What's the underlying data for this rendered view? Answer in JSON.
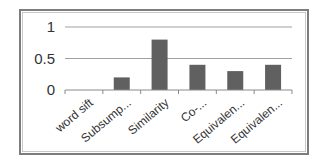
{
  "chart_data": {
    "type": "bar",
    "title": "",
    "xlabel": "",
    "ylabel": "",
    "categories": [
      "word sift",
      "Subsump...",
      "Similarity",
      "Co-...",
      "Equivalen...",
      "Equivalen..."
    ],
    "values": [
      0,
      0.2,
      0.8,
      0.4,
      0.3,
      0.4
    ],
    "ylim": [
      0,
      1
    ],
    "yticks": [
      "0",
      "0.5",
      "1"
    ],
    "grid": true,
    "legend": null,
    "bar_color": "#606060"
  }
}
